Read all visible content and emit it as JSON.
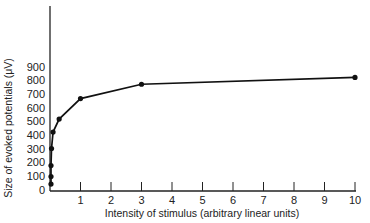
{
  "chart_data": {
    "type": "line",
    "title": "",
    "xlabel": "Intensity of stimulus (arbitrary linear units)",
    "ylabel": "Size of evoked potentials (μV)",
    "x_ticks": [
      1,
      2,
      3,
      4,
      5,
      6,
      7,
      8,
      9,
      10
    ],
    "y_ticks": [
      0,
      100,
      200,
      300,
      400,
      500,
      600,
      700,
      800,
      900
    ],
    "xlim": [
      0,
      10
    ],
    "ylim": [
      0,
      900
    ],
    "grid": false,
    "legend": null,
    "series": [
      {
        "name": "evoked potential",
        "x": [
          0,
          0,
          0,
          0.05,
          0.1,
          0.3,
          1,
          3,
          10
        ],
        "y": [
          40,
          95,
          175,
          300,
          420,
          515,
          665,
          770,
          820
        ]
      }
    ]
  }
}
